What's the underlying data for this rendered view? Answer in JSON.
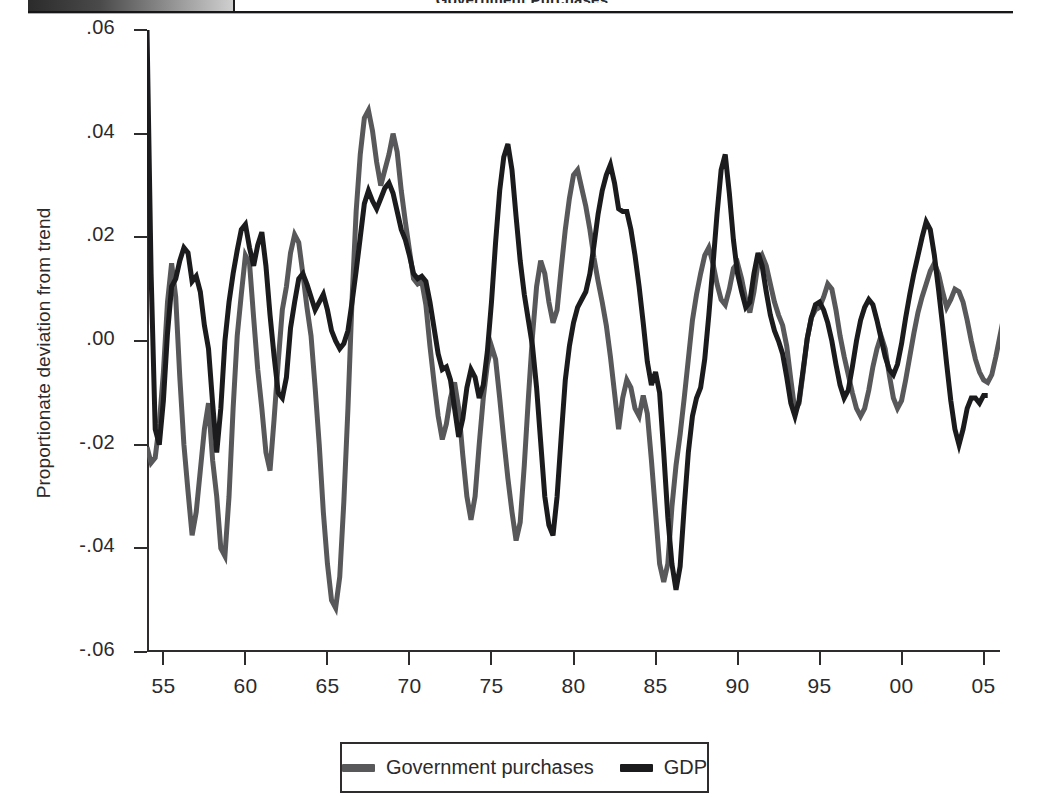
{
  "header": {
    "title": "Government Purchases",
    "divider_icon": "vertical-rule-icon"
  },
  "figure": {
    "y_axis_title": "Proportionate deviation from trend"
  },
  "legend": {
    "items": [
      {
        "label": "Government purchases",
        "color": "#58585a",
        "swatch_icon": "line-swatch-icon"
      },
      {
        "label": "GDP",
        "color": "#1b1b1d",
        "swatch_icon": "line-swatch-icon"
      }
    ]
  },
  "chart_data": {
    "type": "line",
    "title": "Government Purchases",
    "xlabel": "",
    "ylabel": "Proportionate deviation from trend",
    "grid": false,
    "legend_position": "bottom-center",
    "xlim": [
      1954.0,
      2006.0
    ],
    "ylim": [
      -0.06,
      0.06
    ],
    "ytick_labels": [
      ".06",
      ".04",
      ".02",
      ".00",
      "-.02",
      "-.04",
      "-.06"
    ],
    "ytick_values": [
      0.06,
      0.04,
      0.02,
      0.0,
      -0.02,
      -0.04,
      -0.06
    ],
    "xtick_labels": [
      "55",
      "60",
      "65",
      "70",
      "75",
      "80",
      "85",
      "90",
      "95",
      "00",
      "05"
    ],
    "xtick_values": [
      1955,
      1960,
      1965,
      1970,
      1975,
      1980,
      1985,
      1990,
      1995,
      2000,
      2005
    ],
    "x_start": 1954.0,
    "x_step": 0.25,
    "series": [
      {
        "name": "Government purchases",
        "color": "#58585a",
        "linewidth": 5,
        "values": [
          -0.0205,
          -0.0235,
          -0.0225,
          -0.016,
          -0.006,
          0.0075,
          0.015,
          0.0085,
          -0.007,
          -0.02,
          -0.029,
          -0.0375,
          -0.033,
          -0.025,
          -0.017,
          -0.012,
          -0.023,
          -0.03,
          -0.04,
          -0.0415,
          -0.03,
          -0.013,
          0.001,
          0.009,
          0.0165,
          0.015,
          0.0045,
          -0.0055,
          -0.013,
          -0.0215,
          -0.025,
          -0.015,
          -0.004,
          0.006,
          0.0105,
          0.017,
          0.0205,
          0.019,
          0.013,
          0.0065,
          0.001,
          -0.009,
          -0.02,
          -0.033,
          -0.043,
          -0.05,
          -0.0515,
          -0.0455,
          -0.031,
          -0.013,
          0.008,
          0.025,
          0.036,
          0.043,
          0.0445,
          0.0405,
          0.0345,
          0.03,
          0.033,
          0.036,
          0.04,
          0.0365,
          0.029,
          0.023,
          0.0175,
          0.012,
          0.011,
          0.0115,
          0.007,
          -0.001,
          -0.008,
          -0.0145,
          -0.019,
          -0.016,
          -0.011,
          -0.008,
          -0.013,
          -0.022,
          -0.03,
          -0.0345,
          -0.03,
          -0.02,
          -0.011,
          -0.0045,
          -0.001,
          -0.0035,
          -0.011,
          -0.019,
          -0.0265,
          -0.033,
          -0.0385,
          -0.035,
          -0.024,
          -0.011,
          0.001,
          0.0105,
          0.0155,
          0.013,
          0.0075,
          0.0035,
          0.006,
          0.014,
          0.0215,
          0.0275,
          0.032,
          0.033,
          0.0295,
          0.026,
          0.0215,
          0.016,
          0.0115,
          0.0075,
          0.003,
          -0.003,
          -0.01,
          -0.017,
          -0.011,
          -0.0075,
          -0.009,
          -0.013,
          -0.0145,
          -0.0105,
          -0.014,
          -0.023,
          -0.033,
          -0.043,
          -0.0465,
          -0.043,
          -0.032,
          -0.024,
          -0.018,
          -0.011,
          -0.0035,
          0.004,
          0.009,
          0.013,
          0.0165,
          0.018,
          0.015,
          0.011,
          0.008,
          0.007,
          0.01,
          0.014,
          0.015,
          0.012,
          0.008,
          0.0055,
          0.0095,
          0.015,
          0.0165,
          0.0145,
          0.011,
          0.0075,
          0.005,
          0.003,
          -0.001,
          -0.0075,
          -0.0135,
          -0.012,
          -0.006,
          0.0005,
          0.0045,
          0.006,
          0.0065,
          0.0085,
          0.011,
          0.01,
          0.006,
          0.001,
          -0.003,
          -0.0065,
          -0.01,
          -0.013,
          -0.0145,
          -0.013,
          -0.0095,
          -0.005,
          -0.0015,
          0.001,
          -0.0015,
          -0.0065,
          -0.011,
          -0.013,
          -0.0115,
          -0.0075,
          -0.003,
          0.0015,
          0.0055,
          0.0085,
          0.011,
          0.0135,
          0.015,
          0.013,
          0.0095,
          0.0065,
          0.008,
          0.01,
          0.0095,
          0.0075,
          0.004,
          0.0,
          -0.0035,
          -0.006,
          -0.0075,
          -0.008,
          -0.0065,
          -0.003,
          0.001,
          0.005
        ]
      },
      {
        "name": "GDP",
        "color": "#1b1b1d",
        "linewidth": 5,
        "values": [
          0.06,
          0.013,
          -0.017,
          -0.02,
          -0.0115,
          0.0015,
          0.0105,
          0.012,
          0.0155,
          0.018,
          0.017,
          0.0115,
          0.0125,
          0.0095,
          0.003,
          -0.0015,
          -0.012,
          -0.0215,
          -0.013,
          0.0,
          0.0075,
          0.013,
          0.0175,
          0.0215,
          0.0225,
          0.018,
          0.0145,
          0.0185,
          0.021,
          0.0145,
          0.005,
          -0.003,
          -0.01,
          -0.011,
          -0.007,
          0.0025,
          0.0075,
          0.012,
          0.013,
          0.011,
          0.0085,
          0.006,
          0.0075,
          0.009,
          0.006,
          0.002,
          0.0,
          -0.0015,
          -0.0005,
          0.002,
          0.0075,
          0.0135,
          0.02,
          0.0265,
          0.029,
          0.027,
          0.0255,
          0.0275,
          0.0295,
          0.0305,
          0.0285,
          0.025,
          0.0215,
          0.0195,
          0.0165,
          0.013,
          0.012,
          0.0125,
          0.0115,
          0.0075,
          0.0025,
          -0.0025,
          -0.0055,
          -0.005,
          -0.0075,
          -0.013,
          -0.0185,
          -0.015,
          -0.009,
          -0.0055,
          -0.007,
          -0.011,
          -0.0085,
          -0.002,
          0.0075,
          0.019,
          0.029,
          0.0355,
          0.038,
          0.033,
          0.024,
          0.0155,
          0.009,
          0.004,
          -0.001,
          -0.009,
          -0.0195,
          -0.03,
          -0.0355,
          -0.0375,
          -0.03,
          -0.0185,
          -0.0075,
          -0.001,
          0.0035,
          0.0065,
          0.008,
          0.0095,
          0.013,
          0.0185,
          0.0245,
          0.029,
          0.032,
          0.034,
          0.0305,
          0.0255,
          0.025,
          0.025,
          0.0215,
          0.0165,
          0.0105,
          0.0035,
          -0.004,
          -0.0085,
          -0.006,
          -0.01,
          -0.0215,
          -0.034,
          -0.043,
          -0.048,
          -0.0435,
          -0.032,
          -0.0215,
          -0.0145,
          -0.011,
          -0.009,
          -0.0035,
          0.005,
          0.0145,
          0.0245,
          0.033,
          0.036,
          0.0285,
          0.0195,
          0.013,
          0.0095,
          0.0065,
          0.0075,
          0.013,
          0.017,
          0.0145,
          0.0095,
          0.005,
          0.002,
          0.0,
          -0.0025,
          -0.007,
          -0.012,
          -0.0145,
          -0.0115,
          -0.0055,
          0.0005,
          0.0045,
          0.007,
          0.0075,
          0.006,
          0.0035,
          0.0,
          -0.0045,
          -0.0085,
          -0.011,
          -0.0095,
          -0.005,
          0.0,
          0.004,
          0.0065,
          0.008,
          0.007,
          0.004,
          0.0005,
          -0.003,
          -0.0055,
          -0.0065,
          -0.0045,
          -0.0005,
          0.0045,
          0.009,
          0.013,
          0.0165,
          0.02,
          0.023,
          0.0215,
          0.0165,
          0.01,
          0.003,
          -0.0045,
          -0.0115,
          -0.017,
          -0.02,
          -0.017,
          -0.013,
          -0.011,
          -0.011,
          -0.012,
          -0.0105,
          -0.0105
        ]
      }
    ]
  }
}
